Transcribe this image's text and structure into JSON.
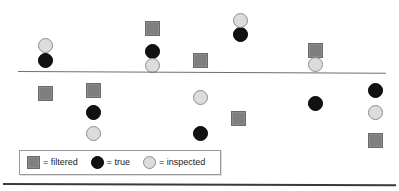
{
  "figure": {
    "width": 399,
    "height": 191,
    "background": "#ffffff"
  },
  "colors": {
    "filtered": "#7f7f7f",
    "true": "#121212",
    "inspected": "#dcdcdc",
    "axis_line": "#6f6f6f",
    "bottom_rule": "#3a3a3a",
    "legend_border": "#9a9a9a",
    "text": "#1a1a1a"
  },
  "axis_line": {
    "name": "horizontal-separator"
  },
  "legend": {
    "entries": [
      {
        "icon": "filtered-square-icon",
        "shape": "square",
        "label": "= filtered",
        "color": "#7f7f7f"
      },
      {
        "icon": "true-circle-icon",
        "shape": "circle-true",
        "label": "= true",
        "color": "#121212"
      },
      {
        "icon": "inspected-circle-icon",
        "shape": "circle-inspected",
        "label": "= inspected",
        "color": "#dcdcdc"
      }
    ]
  },
  "chart_data": {
    "type": "scatter",
    "title": "",
    "xlabel": "",
    "ylabel": "",
    "grid": false,
    "legend_position": "bottom-left",
    "annotations": [
      {
        "type": "hline",
        "label": "separator",
        "y": 71,
        "x_start": 18,
        "x_end": 386
      },
      {
        "type": "rule",
        "label": "bottom-border",
        "y": 183,
        "x_start": 3,
        "x_end": 396
      }
    ],
    "series": [
      {
        "name": "filtered",
        "marker": "square",
        "color": "#7f7f7f",
        "points": [
          {
            "x": 152,
            "y": 28,
            "region": "above"
          },
          {
            "x": 200,
            "y": 60,
            "region": "above"
          },
          {
            "x": 315,
            "y": 50,
            "region": "above"
          },
          {
            "x": 45,
            "y": 93,
            "region": "below"
          },
          {
            "x": 93,
            "y": 90,
            "region": "below"
          },
          {
            "x": 238,
            "y": 118,
            "region": "below"
          },
          {
            "x": 375,
            "y": 140,
            "region": "below"
          }
        ]
      },
      {
        "name": "true",
        "marker": "circle",
        "color": "#121212",
        "points": [
          {
            "x": 45,
            "y": 60,
            "region": "above"
          },
          {
            "x": 152,
            "y": 51,
            "region": "above"
          },
          {
            "x": 240,
            "y": 34,
            "region": "above"
          },
          {
            "x": 93,
            "y": 112,
            "region": "below"
          },
          {
            "x": 200,
            "y": 133,
            "region": "below"
          },
          {
            "x": 315,
            "y": 103,
            "region": "below"
          },
          {
            "x": 375,
            "y": 90,
            "region": "below"
          }
        ]
      },
      {
        "name": "inspected",
        "marker": "circle",
        "color": "#dcdcdc",
        "points": [
          {
            "x": 45,
            "y": 45,
            "region": "above"
          },
          {
            "x": 152,
            "y": 65,
            "region": "above"
          },
          {
            "x": 240,
            "y": 20,
            "region": "above"
          },
          {
            "x": 315,
            "y": 64,
            "region": "above"
          },
          {
            "x": 93,
            "y": 133,
            "region": "below"
          },
          {
            "x": 200,
            "y": 97,
            "region": "below"
          },
          {
            "x": 375,
            "y": 112,
            "region": "below"
          }
        ]
      }
    ]
  }
}
